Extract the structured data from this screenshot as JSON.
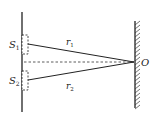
{
  "diagram": {
    "type": "double-slit-geometry",
    "sources": [
      {
        "id": "S1",
        "label": "S",
        "subscript": "1"
      },
      {
        "id": "S2",
        "label": "S",
        "subscript": "2"
      }
    ],
    "paths": [
      {
        "id": "r1",
        "label": "r",
        "subscript": "1"
      },
      {
        "id": "r2",
        "label": "r",
        "subscript": "2"
      }
    ],
    "point": {
      "label": "O"
    },
    "colors": {
      "stroke": "#222222",
      "background": "#ffffff"
    }
  }
}
